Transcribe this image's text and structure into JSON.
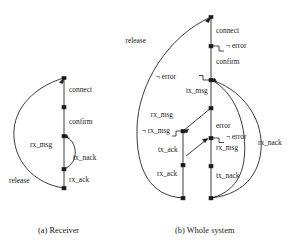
{
  "figure": {
    "background": "#ffffff",
    "ink": "#1a1a1a",
    "edge_color": "#262626"
  },
  "panels": [
    {
      "id": "a",
      "caption": "(a) Receiver",
      "spine": {
        "x": 64,
        "y_top": 78,
        "y_bottom": 188
      },
      "nodes": [
        {
          "name": "node-a-top",
          "x": 64,
          "y": 78
        },
        {
          "name": "node-a-confirm",
          "x": 64,
          "y": 107
        },
        {
          "name": "node-a-txnack",
          "x": 64,
          "y": 136
        },
        {
          "name": "node-a-rxack",
          "x": 64,
          "y": 169
        },
        {
          "name": "node-a-bottom",
          "x": 64,
          "y": 188
        }
      ],
      "edge_labels": [
        {
          "name": "edge-label-connect",
          "text": "connect",
          "x": 69,
          "y": 92
        },
        {
          "name": "edge-label-confirm",
          "text": "confirm",
          "x": 69,
          "y": 124
        },
        {
          "name": "edge-label-rx-msg",
          "text": "rx_msg",
          "x": 30,
          "y": 147
        },
        {
          "name": "edge-label-tx-nack",
          "text": "tx_nack",
          "x": 73,
          "y": 160
        },
        {
          "name": "edge-label-rx-ack",
          "text": "rx_ack",
          "x": 69,
          "y": 182
        },
        {
          "name": "edge-label-release",
          "text": "release",
          "x": 9,
          "y": 183
        }
      ]
    },
    {
      "id": "b",
      "caption": "(b) Whole system",
      "spine_right": {
        "x": 211,
        "y_top": 17,
        "y_bottom": 198
      },
      "spine_left": {
        "x": 183,
        "y_top": 131,
        "y_bottom": 198
      },
      "nodes": [
        {
          "name": "node-b-top",
          "x": 211,
          "y": 17
        },
        {
          "name": "node-b-connect",
          "x": 211,
          "y": 46
        },
        {
          "name": "node-b-confirm",
          "x": 211,
          "y": 80
        },
        {
          "name": "node-b-txmsg",
          "x": 211,
          "y": 108
        },
        {
          "name": "node-b-error",
          "x": 211,
          "y": 138
        },
        {
          "name": "node-b-rxmsg",
          "x": 211,
          "y": 166
        },
        {
          "name": "node-b-bottom-right",
          "x": 211,
          "y": 198
        },
        {
          "name": "node-b-rxmsg-left",
          "x": 183,
          "y": 131
        },
        {
          "name": "node-b-txack",
          "x": 183,
          "y": 165
        },
        {
          "name": "node-b-bottom-left",
          "x": 183,
          "y": 198
        }
      ],
      "edge_labels": [
        {
          "name": "edge-label-connect",
          "text": "connect",
          "x": 216,
          "y": 33
        },
        {
          "name": "edge-label-not-error-1",
          "text": "¬ error",
          "x": 226,
          "y": 48
        },
        {
          "name": "edge-label-confirm",
          "text": "confirm",
          "x": 216,
          "y": 64
        },
        {
          "name": "edge-label-not-error-2",
          "text": "¬ error",
          "x": 176,
          "y": 79
        },
        {
          "name": "edge-label-tx-msg",
          "text": "tx_msg",
          "x": 186,
          "y": 93
        },
        {
          "name": "edge-label-rx-msg-upper",
          "text": "rx_msg",
          "x": 173,
          "y": 117
        },
        {
          "name": "edge-label-error",
          "text": "error",
          "x": 216,
          "y": 128
        },
        {
          "name": "edge-label-not-rx-msg",
          "text": "¬ rx_msg",
          "x": 152,
          "y": 133
        },
        {
          "name": "edge-label-not-error-3",
          "text": "¬ error",
          "x": 226,
          "y": 139
        },
        {
          "name": "edge-label-rx-msg-lower",
          "text": "rx_msg",
          "x": 216,
          "y": 150
        },
        {
          "name": "edge-label-tx-ack",
          "text": "tx_ack",
          "x": 158,
          "y": 152
        },
        {
          "name": "edge-label-rx-nack",
          "text": "rx_nack",
          "x": 258,
          "y": 145
        },
        {
          "name": "edge-label-rx-ack",
          "text": "rx_ack",
          "x": 157,
          "y": 176
        },
        {
          "name": "edge-label-tx-nack",
          "text": "tx_nack",
          "x": 216,
          "y": 178
        },
        {
          "name": "edge-label-release",
          "text": "release",
          "x": 146,
          "y": 43
        }
      ]
    }
  ]
}
